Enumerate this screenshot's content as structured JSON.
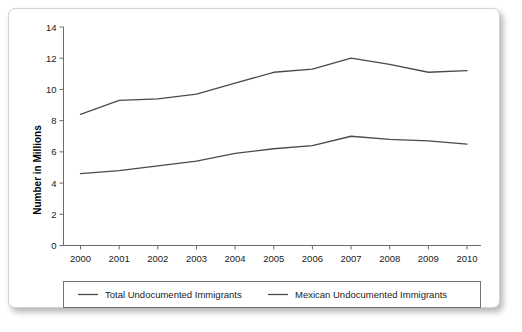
{
  "chart_data": {
    "type": "line",
    "title": "",
    "xlabel": "",
    "ylabel": "Number in Millions",
    "categories": [
      "2000",
      "2001",
      "2002",
      "2003",
      "2004",
      "2005",
      "2006",
      "2007",
      "2008",
      "2009",
      "2010"
    ],
    "x": [
      2000,
      2001,
      2002,
      2003,
      2004,
      2005,
      2006,
      2007,
      2008,
      2009,
      2010
    ],
    "series": [
      {
        "name": "Total Undocumented Immigrants",
        "values": [
          8.4,
          9.3,
          9.4,
          9.7,
          10.4,
          11.1,
          11.3,
          12.0,
          11.6,
          11.1,
          11.2
        ],
        "color": "#4a4a4a"
      },
      {
        "name": "Mexican Undocumented Immigrants",
        "values": [
          4.6,
          4.8,
          5.1,
          5.4,
          5.9,
          6.2,
          6.4,
          7.0,
          6.8,
          6.7,
          6.5
        ],
        "color": "#4a4a4a"
      }
    ],
    "ylim": [
      0,
      14
    ],
    "yticks": [
      0,
      2,
      4,
      6,
      8,
      10,
      12,
      14
    ],
    "ytick_labels": [
      "0",
      "2",
      "4",
      "6",
      "8",
      "10",
      "12",
      "14"
    ],
    "grid": false,
    "legend_position": "bottom"
  },
  "legend": {
    "entries": [
      {
        "label": "Total Undocumented Immigrants"
      },
      {
        "label": "Mexican Undocumented Immigrants"
      }
    ]
  },
  "axes": {
    "y_title": "Number in Millions"
  }
}
